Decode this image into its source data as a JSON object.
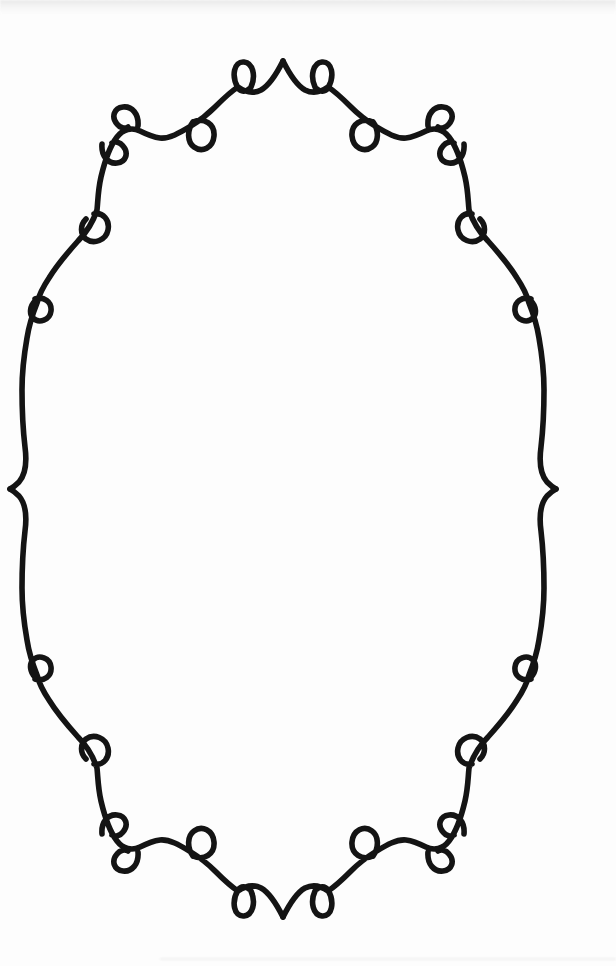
{
  "canvas": {
    "width": 616,
    "height": 966,
    "background": "#fdfdfd"
  },
  "frame": {
    "stroke_color": "#141414",
    "stroke_width": 5.6,
    "quarter_path": "M283 61 C288 71 296 85 305 90 C313 94 321 92 328 87 C336 92 344 100 351 107 C359 115 367 121 375 126 C385 132 396 139 406 138 C414 137 420 134 426 131 C434 127 443 129 449 137 C456 146 461 160 465 177 C468 190 468 200 469 210 C473 222 480 233 488 241 C497 251 509 265 517 278 C523 287 527 295 529 303 C533 313 537 325 539 338 C542 355 544 372 544 390 C544 412 543 430 541 447 C539 462 540 474 547 482 C551 486 554 488 556 489 M315 87 C310 76 313 63 322 62 C332 61 335 76 328 88 C325 92 320 92 317 89 M373 122 C362 117 351 124 352 136 C353 148 364 153 372 147 C379 142 379 130 373 122 M428 126 C427 114 434 106 443 107 C452 108 455 117 449 124 C446 128 441 129 438 127 M464 144 C465 156 458 164 449 163 C440 162 437 153 443 146 C446 142 451 141 454 143 M472 214 C463 212 456 220 458 230 C460 240 472 245 480 239 C486 234 486 225 480 219 M531 299 C522 296 514 302 515 311 C516 320 527 324 533 318 C537 314 536 306 531 301"
  },
  "artifacts": {
    "top_band_color": "#e6e6e6",
    "bottom_streak_color": "#d9d9d9"
  }
}
